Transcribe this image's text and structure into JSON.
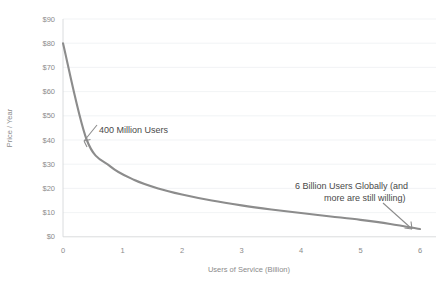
{
  "chart_data": {
    "type": "line",
    "title": "",
    "xlabel": "Users of Service (Billion)",
    "ylabel": "Price / Year",
    "xlim": [
      0,
      6
    ],
    "ylim": [
      0,
      90
    ],
    "grid": true,
    "legend": "none",
    "x_ticks": [
      "0",
      "1",
      "2",
      "3",
      "4",
      "5",
      "6"
    ],
    "y_ticks": [
      "$0",
      "$10",
      "$20",
      "$30",
      "$40",
      "$50",
      "$60",
      "$70",
      "$80",
      "$90"
    ],
    "series": [
      {
        "name": "Price vs Users",
        "color": "#8c8c8c",
        "x": [
          0,
          0.4,
          0.8,
          1.2,
          1.6,
          2.0,
          2.5,
          3.0,
          3.5,
          4.0,
          4.5,
          5.0,
          5.5,
          6.0
        ],
        "values": [
          80,
          40,
          29,
          23.5,
          20,
          17.5,
          15,
          13,
          11.3,
          9.8,
          8.4,
          7.0,
          5.3,
          3.2
        ]
      }
    ],
    "annotations": [
      {
        "name": "point-400-million",
        "text": "400 Million Users",
        "x": 0.4,
        "y": 40,
        "text_x_px": 99,
        "text_y_px": 133
      },
      {
        "name": "point-6-billion",
        "text_line1": "6 Billion Users Globally (and",
        "text_line2": "more are still willing)",
        "x": 6,
        "y": 3.2,
        "text_x_px": 295,
        "text_y_px": 189
      }
    ]
  }
}
